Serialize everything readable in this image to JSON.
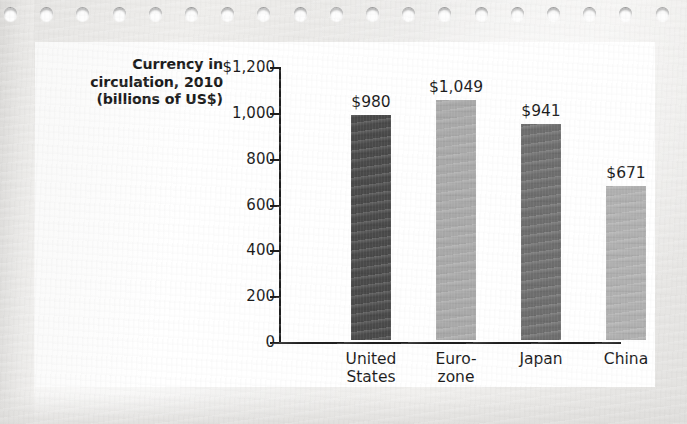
{
  "card": {
    "title_lines": [
      "Currency in",
      "circulation, 2010",
      "(billions of US$)"
    ]
  },
  "chart_data": {
    "type": "bar",
    "title": "Currency in circulation, 2010 (billions of US$)",
    "xlabel": "",
    "ylabel": "Currency in circulation, 2010 (billions of US$)",
    "categories": [
      "United States",
      "Euro-zone",
      "Japan",
      "China"
    ],
    "category_label_lines": [
      [
        "United",
        "States"
      ],
      [
        "Euro-",
        "zone"
      ],
      [
        "Japan",
        ""
      ],
      [
        "China",
        ""
      ]
    ],
    "values": [
      980,
      1049,
      941,
      671
    ],
    "value_labels": [
      "$980",
      "$1,049",
      "$941",
      "$671"
    ],
    "bar_colors": [
      "#4a4a4a",
      "#a9a9a9",
      "#6e6e6e",
      "#b0b0b0"
    ],
    "ylim": [
      0,
      1200
    ],
    "yticks": [
      0,
      200,
      400,
      600,
      800,
      1000,
      1200
    ],
    "ytick_labels": [
      "0",
      "200",
      "400",
      "600",
      "800",
      "1,000",
      "$1,200"
    ],
    "grid": false,
    "legend": "none"
  }
}
